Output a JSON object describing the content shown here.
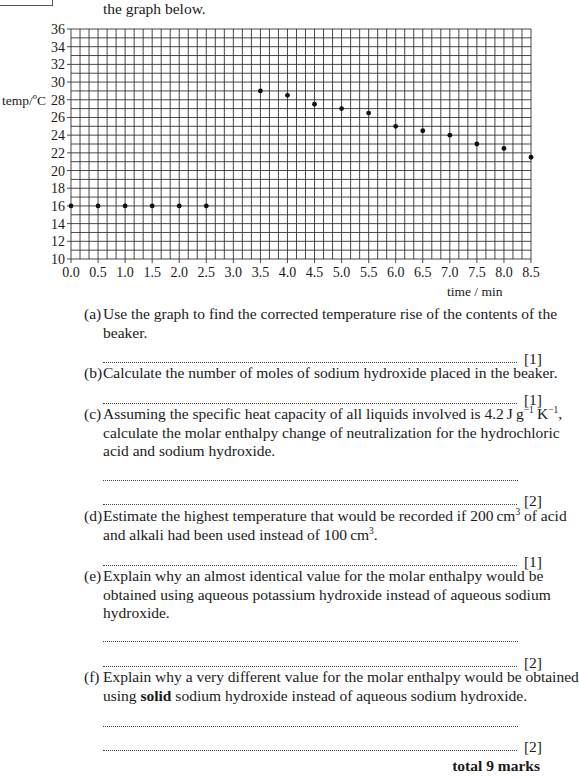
{
  "header": {
    "intro_text": "the graph below."
  },
  "chart_data": {
    "type": "scatter",
    "title": "",
    "xlabel": "time / min",
    "ylabel": "temp/ºC",
    "xlim": [
      0.0,
      8.5
    ],
    "ylim": [
      10,
      36
    ],
    "grid": true,
    "grid_minor_x": 0.1666667,
    "grid_minor_y": 1,
    "legend": null,
    "x_ticks": [
      "0.0",
      "0.5",
      "1.0",
      "1.5",
      "2.0",
      "2.5",
      "3.0",
      "3.5",
      "4.0",
      "4.5",
      "5.0",
      "5.5",
      "6.0",
      "6.5",
      "7.0",
      "7.5",
      "8.0",
      "8.5"
    ],
    "y_ticks": [
      "10",
      "12",
      "14",
      "16",
      "18",
      "20",
      "22",
      "24",
      "26",
      "28",
      "30",
      "32",
      "34",
      "36"
    ],
    "series": [
      {
        "name": "temperature",
        "x": [
          0.0,
          0.5,
          1.0,
          1.5,
          2.0,
          2.5,
          3.5,
          4.0,
          4.5,
          5.0,
          5.5,
          6.0,
          6.5,
          7.0,
          7.5,
          8.0,
          8.5
        ],
        "y": [
          16,
          16,
          16,
          16,
          16,
          16,
          29,
          28.5,
          27.5,
          27,
          26.5,
          25,
          24.5,
          24,
          23,
          22.5,
          21.5
        ]
      }
    ]
  },
  "questions": [
    {
      "label": "(a)",
      "lines": [
        "Use the graph to find the corrected temperature rise of the contents of the",
        "beaker."
      ],
      "marks": "[1]"
    },
    {
      "label": "(b)",
      "lines": [
        "Calculate the number of moles of sodium hydroxide placed in the beaker."
      ],
      "marks": "[1]"
    },
    {
      "label": "(c)",
      "lines": [
        "Assuming the specific heat capacity of all liquids involved is 4.2 J g⁻¹ K⁻¹,",
        "calculate the molar enthalpy change of neutralization for the hydrochloric",
        "acid and sodium hydroxide."
      ],
      "line1_prefix": "Assuming the specific heat capacity of all liquids involved is 4.2 J g",
      "line1_sup1": "−1",
      "line1_mid": " K",
      "line1_sup2": "−1",
      "line1_suffix": ",",
      "marks": "[2]"
    },
    {
      "label": "(d)",
      "lines": [
        "Estimate the highest temperature that would be recorded if 200 cm³ of acid",
        "and alkali had been used instead of 100 cm³."
      ],
      "line1_prefix": "Estimate the highest temperature that would be recorded if 200 cm",
      "line1_sup": "3",
      "line1_suffix": " of acid",
      "line2_prefix": "and alkali had been used instead of 100 cm",
      "line2_sup": "3",
      "line2_suffix": ".",
      "marks": "[1]"
    },
    {
      "label": "(e)",
      "lines": [
        "Explain why an almost identical value for the molar enthalpy would be",
        "obtained using aqueous potassium hydroxide instead of aqueous sodium",
        "hydroxide."
      ],
      "marks": "[2]"
    },
    {
      "label": "(f)",
      "lines": [
        "Explain why a very different value for the molar enthalpy would be obtained",
        "using solid sodium hydroxide instead of aqueous sodium hydroxide."
      ],
      "line2_prefix": "using ",
      "line2_bold": "solid",
      "line2_suffix": " sodium hydroxide instead of aqueous sodium hydroxide.",
      "marks": "[2]"
    }
  ],
  "footer": {
    "total": "total 9 marks"
  }
}
